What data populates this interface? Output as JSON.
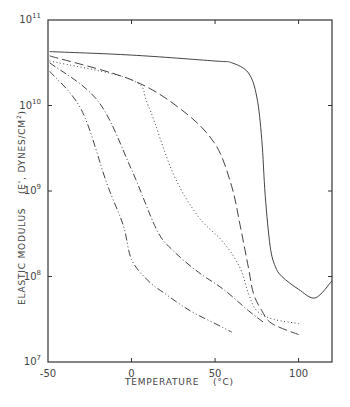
{
  "chart_data": {
    "type": "line",
    "title": "",
    "xlabel": "TEMPERATURE (°C)",
    "ylabel": "ELASTIC MODULUS (E', DYNES/CM²)",
    "xlim": [
      -50,
      120
    ],
    "ylim": [
      10000000,
      100000000000
    ],
    "yscale": "log",
    "grid": false,
    "legend": null,
    "x_ticks": [
      -50,
      0,
      50,
      100
    ],
    "x_tick_labels": [
      "-50",
      "0",
      "50",
      "100"
    ],
    "y_ticks": [
      10000000,
      100000000,
      1000000000,
      10000000000,
      100000000000
    ],
    "y_tick_labels": [
      {
        "base": "10",
        "exp": "7"
      },
      {
        "base": "10",
        "exp": "8"
      },
      {
        "base": "10",
        "exp": "9"
      },
      {
        "base": "10",
        "exp": "10"
      },
      {
        "base": "10",
        "exp": "11"
      }
    ],
    "series": [
      {
        "name": "solid",
        "style": "solid",
        "x": [
          -49,
          0,
          50,
          60,
          70,
          75,
          78,
          80,
          83,
          86,
          90,
          100,
          110,
          120
        ],
        "y_log10": [
          10.63,
          10.59,
          10.52,
          10.5,
          10.38,
          10.1,
          9.6,
          8.95,
          8.35,
          8.12,
          8.0,
          7.85,
          7.75,
          7.95
        ]
      },
      {
        "name": "dashed",
        "style": "dashed",
        "x": [
          -49,
          0,
          30,
          50,
          60,
          65,
          70,
          73,
          78,
          84,
          100
        ],
        "y_log10": [
          10.58,
          10.3,
          10.0,
          9.7,
          9.4,
          9.1,
          8.8,
          8.2,
          7.7,
          7.4,
          7.35
        ],
        "y_log10_corrected": [
          10.58,
          10.3,
          9.95,
          9.55,
          9.05,
          8.6,
          8.1,
          7.8,
          7.6,
          7.45,
          7.32
        ]
      },
      {
        "name": "dotted",
        "style": "dotted",
        "x": [
          -49,
          0,
          10,
          25,
          40,
          55,
          65,
          70,
          75,
          85,
          100
        ],
        "y_log10": [
          10.52,
          10.3,
          10.0,
          9.2,
          8.7,
          8.4,
          8.1,
          7.8,
          7.6,
          7.5,
          7.45
        ]
      },
      {
        "name": "dash-dot",
        "style": "dash-dot",
        "x": [
          -49,
          -20,
          0,
          15,
          25,
          40,
          55,
          70,
          80
        ],
        "y_log10": [
          10.5,
          10.05,
          9.25,
          8.55,
          8.3,
          8.05,
          7.85,
          7.6,
          7.45
        ]
      },
      {
        "name": "dash-dot-dot",
        "style": "dash-dot-dot",
        "x": [
          -49,
          -30,
          -15,
          -5,
          0,
          10,
          20,
          35,
          50,
          60
        ],
        "y_log10": [
          10.4,
          9.95,
          9.1,
          8.6,
          8.2,
          7.95,
          7.8,
          7.6,
          7.45,
          7.35
        ]
      }
    ]
  },
  "labels": {
    "xlabel": "TEMPERATURE",
    "xlabel_unit": "(°C)",
    "ylabel_main": "ELASTIC MODULUS",
    "ylabel_unit": "(E', DYNES/CM",
    "ylabel_sup": "2",
    "ylabel_close": ")"
  }
}
